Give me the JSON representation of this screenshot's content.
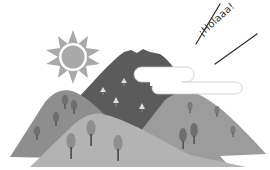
{
  "illustration": {
    "description": "Grayscale clip-art of mountains with trees, a sun, a cloud and a greeting",
    "greeting_text": "¡Holaaa!",
    "colors": {
      "background": "#ffffff",
      "sun": "#a9a9a9",
      "sun_ring": "#ffffff",
      "dark_mountain": "#5b5b5b",
      "left_mountain": "#8e8e8e",
      "right_mountain": "#9c9c9c",
      "front_hill": "#b3b3b3",
      "cloud": "#ffffff",
      "cloud_outline": "#c8c8c8",
      "tree_dark": "#6e6e6e",
      "tree_light": "#dcdcdc",
      "trunk": "#4a4a4a",
      "text": "#333333"
    }
  }
}
